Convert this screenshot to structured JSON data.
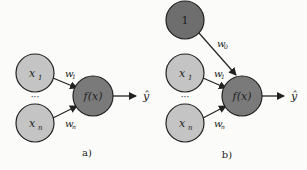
{
  "colors": {
    "input_fill": "#c4c4c4",
    "bias_fill": "#6e6e6e",
    "neuron_fill": "#7a7a7a",
    "stroke": "#222222",
    "background": "#fbfbf9"
  },
  "panel_a": {
    "caption": "a)",
    "inputs": [
      {
        "label": "x",
        "subscript": "1"
      },
      {
        "label": "x",
        "subscript": "n"
      }
    ],
    "ellipsis": "···",
    "weights": [
      {
        "label": "w",
        "subscript": "1"
      },
      {
        "label": "w",
        "subscript": "n"
      }
    ],
    "neuron": "f(x)",
    "output": "ŷ"
  },
  "panel_b": {
    "caption": "b)",
    "bias": {
      "label": "1",
      "weight": "w",
      "weight_subscript": "0"
    },
    "inputs": [
      {
        "label": "x",
        "subscript": "1"
      },
      {
        "label": "x",
        "subscript": "n"
      }
    ],
    "ellipsis": "···",
    "weights": [
      {
        "label": "w",
        "subscript": "1"
      },
      {
        "label": "w",
        "subscript": "n"
      }
    ],
    "neuron": "f(x)",
    "output": "ŷ"
  }
}
